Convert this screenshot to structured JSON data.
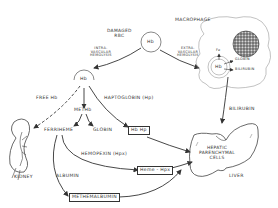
{
  "diagram": {
    "nodes": {
      "damaged_rbc": "DAMAGED RBC",
      "damaged_rbc_line1": "DAMAGED",
      "damaged_rbc_line2": "RBC",
      "hb_top": "Hb",
      "hb_left": "Hb",
      "macrophage": "MACROPHAGE",
      "macrophage_hb": "Hb",
      "fe": "Fe",
      "globin_macro": "GLOBIN",
      "bilirubin_macro": "BILIRUBIN",
      "meth_b": "METHb",
      "ferriheme": "FERRIHEME",
      "globin": "GLOBIN",
      "hb_hp": "Hb Hp",
      "heme_hpx": "Heme - Hpx",
      "methemalbumin": "METHEMALBUMIN",
      "kidney": "KIDNEY",
      "hepatic_line1": "HEPATIC",
      "hepatic_line2": "PARENCHYMAL",
      "hepatic_line3": "CELLS",
      "liver": "LIVER"
    },
    "edge_labels": {
      "intravascular_1": "INTRA-",
      "intravascular_2": "VASCULAR",
      "intravascular_3": "HEMOLYSIS",
      "extravascular_1": "EXTRA-",
      "extravascular_2": "VASCULAR",
      "extravascular_3": "HEMOLYSIS",
      "free_hb": "FREE Hb",
      "haptoglobin": "HAPTOGLOBIN (Hp)",
      "hemopexin": "HEMOPEXIN (Hpx)",
      "albumin": "ALBUMIN",
      "bilirubin": "BILIRUBIN"
    },
    "colors": {
      "line": "#333333",
      "background": "#ffffff",
      "nucleus": "#555555"
    }
  }
}
